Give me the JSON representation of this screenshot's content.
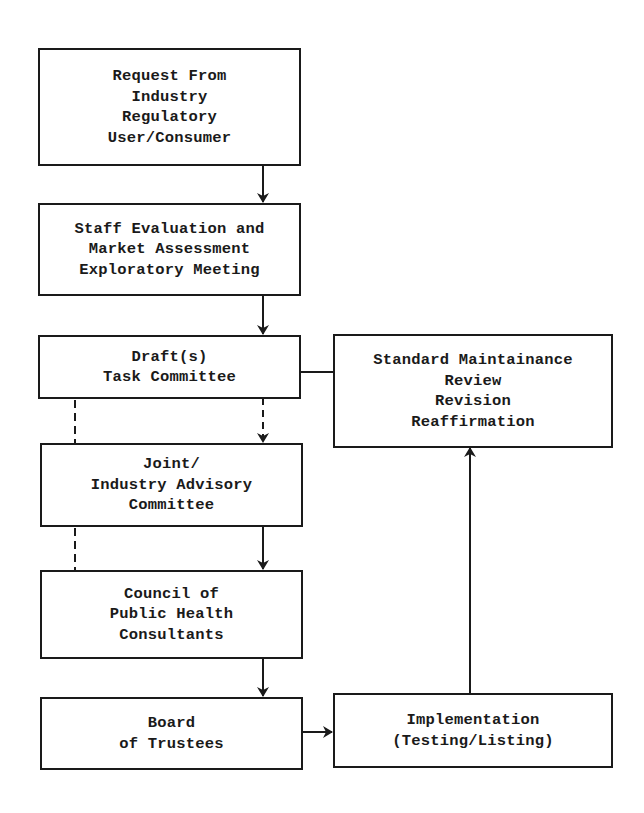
{
  "diagram": {
    "type": "flowchart",
    "nodes": [
      {
        "id": "request",
        "lines": [
          "Request From",
          "Industry",
          "Regulatory",
          "User/Consumer"
        ]
      },
      {
        "id": "staff_eval",
        "lines": [
          "Staff Evaluation and",
          "Market Assessment",
          "Exploratory Meeting"
        ]
      },
      {
        "id": "draft",
        "lines": [
          "Draft(s)",
          "Task Committee"
        ]
      },
      {
        "id": "standard_maintenance",
        "lines": [
          "Standard Maintainance",
          "Review",
          "Revision",
          "Reaffirmation"
        ]
      },
      {
        "id": "joint_committee",
        "lines": [
          "Joint/",
          "Industry Advisory",
          "Committee"
        ]
      },
      {
        "id": "council",
        "lines": [
          "Council of",
          "Public Health",
          "Consultants"
        ]
      },
      {
        "id": "board",
        "lines": [
          "Board",
          "of Trustees"
        ]
      },
      {
        "id": "implementation",
        "lines": [
          "Implementation",
          "(Testing/Listing)"
        ]
      }
    ],
    "edges": [
      {
        "from": "request",
        "to": "staff_eval",
        "style": "solid",
        "arrow": true
      },
      {
        "from": "staff_eval",
        "to": "draft",
        "style": "solid",
        "arrow": true
      },
      {
        "from": "draft",
        "to": "joint_committee",
        "style": "dashed",
        "arrow": true
      },
      {
        "from": "joint_committee",
        "to": "council",
        "style": "solid",
        "arrow": true
      },
      {
        "from": "draft",
        "to": "council",
        "style": "dashed",
        "arrow": false,
        "note": "left-side dashed bypass"
      },
      {
        "from": "council",
        "to": "board",
        "style": "solid",
        "arrow": true
      },
      {
        "from": "board",
        "to": "implementation",
        "style": "solid",
        "arrow": true
      },
      {
        "from": "implementation",
        "to": "standard_maintenance",
        "style": "solid",
        "arrow": true
      },
      {
        "from": "standard_maintenance",
        "to": "draft",
        "style": "solid",
        "arrow": false
      }
    ],
    "colors": {
      "line": "#1a1a1a",
      "background": "#ffffff"
    }
  }
}
